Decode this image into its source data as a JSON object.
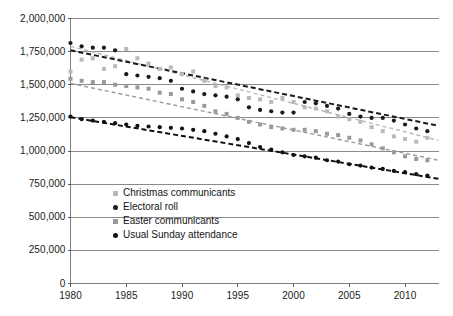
{
  "chart_data": {
    "type": "scatter",
    "title": "",
    "subtitle": "",
    "xlabel": "",
    "ylabel": "",
    "xlim": [
      1980,
      2013
    ],
    "ylim": [
      0,
      2000000
    ],
    "grid": true,
    "grid_axis": "y",
    "legend_position": "inside-lower-left",
    "x_ticks": [
      1980,
      1985,
      1990,
      1995,
      2000,
      2005,
      2010
    ],
    "x_tick_labels": [
      "1980",
      "1985",
      "1990",
      "1995",
      "2000",
      "2005",
      "2010"
    ],
    "y_ticks": [
      0,
      250000,
      500000,
      750000,
      1000000,
      1250000,
      1500000,
      1750000,
      2000000
    ],
    "y_tick_labels": [
      "0",
      "250,000",
      "500,000",
      "750,000",
      "1,000,000",
      "1,250,000",
      "1,500,000",
      "1,750,000",
      "2,000,000"
    ],
    "x": [
      1980,
      1981,
      1982,
      1983,
      1984,
      1985,
      1986,
      1987,
      1988,
      1989,
      1990,
      1991,
      1992,
      1993,
      1994,
      1995,
      1996,
      1997,
      1998,
      1999,
      2000,
      2001,
      2002,
      2003,
      2004,
      2005,
      2006,
      2007,
      2008,
      2009,
      2010,
      2011,
      2012
    ],
    "series": [
      {
        "name": "Christmas communicants",
        "marker": "square",
        "color": "#b9b9b9",
        "trendline": true,
        "trend_color": "#b9b9b9",
        "trend_start": 1790000,
        "trend_end": 1080000,
        "values": [
          1600000,
          1690000,
          1700000,
          1620000,
          1640000,
          1770000,
          1700000,
          1660000,
          1620000,
          1630000,
          1580000,
          1600000,
          1530000,
          1490000,
          1480000,
          1420000,
          1400000,
          1390000,
          1370000,
          1400000,
          1370000,
          1330000,
          1320000,
          1300000,
          1260000,
          1240000,
          1220000,
          1180000,
          1150000,
          1110000,
          1090000,
          1070000,
          1100000
        ]
      },
      {
        "name": "Electoral roll",
        "marker": "circle",
        "color": "#1a1a1a",
        "trendline": true,
        "trend_color": "#1a1a1a",
        "trend_start": 1760000,
        "trend_end": 1190000,
        "values": [
          1815000,
          1790000,
          1780000,
          1780000,
          1760000,
          1580000,
          1570000,
          1560000,
          1550000,
          1530000,
          1470000,
          1450000,
          1430000,
          1420000,
          1410000,
          1390000,
          1330000,
          1310000,
          1300000,
          1290000,
          1290000,
          1370000,
          1360000,
          1340000,
          1320000,
          1280000,
          1260000,
          1250000,
          1250000,
          1230000,
          1200000,
          1170000,
          1150000
        ]
      },
      {
        "name": "Easter communicants",
        "marker": "square",
        "color": "#9a9a9a",
        "trendline": true,
        "trend_color": "#9a9a9a",
        "trend_start": 1510000,
        "trend_end": 930000,
        "values": [
          1545000,
          1530000,
          1520000,
          1520000,
          1500000,
          1490000,
          1480000,
          1470000,
          1440000,
          1430000,
          1390000,
          1370000,
          1340000,
          1300000,
          1280000,
          1250000,
          1220000,
          1200000,
          1180000,
          1170000,
          1160000,
          1160000,
          1150000,
          1130000,
          1120000,
          1100000,
          1080000,
          1050000,
          1020000,
          990000,
          960000,
          940000,
          930000
        ]
      },
      {
        "name": "Usual Sunday attendance",
        "marker": "circle",
        "color": "#111111",
        "trendline": true,
        "trend_color": "#111111",
        "trend_start": 1255000,
        "trend_end": 790000,
        "values": [
          1260000,
          1240000,
          1230000,
          1220000,
          1210000,
          1200000,
          1190000,
          1185000,
          1180000,
          1175000,
          1170000,
          1160000,
          1150000,
          1130000,
          1110000,
          1090000,
          1060000,
          1030000,
          1010000,
          990000,
          970000,
          960000,
          950000,
          930000,
          920000,
          900000,
          890000,
          875000,
          865000,
          850000,
          840000,
          825000,
          815000
        ]
      }
    ]
  },
  "legend": {
    "items": [
      {
        "label": "Christmas communicants",
        "marker": "square",
        "color": "#b9b9b9"
      },
      {
        "label": "Electoral roll",
        "marker": "circle",
        "color": "#1a1a1a"
      },
      {
        "label": "Easter communicants",
        "marker": "square",
        "color": "#9a9a9a"
      },
      {
        "label": "Usual Sunday attendance",
        "marker": "circle",
        "color": "#111111"
      }
    ]
  },
  "axes": {
    "frame_color": "#808080",
    "grid_color": "#8a8a8a",
    "tick_color": "#5a5a5a"
  }
}
